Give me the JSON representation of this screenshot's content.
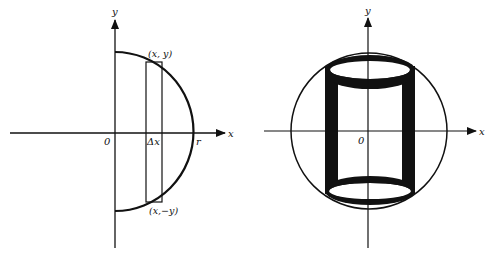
{
  "colors": {
    "ink": "#111111",
    "background": "#ffffff"
  },
  "left_figure": {
    "axis_x_label": "x",
    "axis_y_label": "y",
    "origin_label": "0",
    "radius_label": "r",
    "strip_width_label": "Δx",
    "top_point_label": "(x, y)",
    "bottom_point_label": "(x,−y)",
    "shape": "semicircle-with-vertical-strip"
  },
  "right_figure": {
    "axis_x_label": "x",
    "axis_y_label": "y",
    "origin_label": "0",
    "shape": "circle-with-inscribed-cylindrical-shell"
  }
}
